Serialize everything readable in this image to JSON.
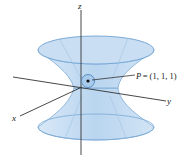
{
  "diagram": {
    "type": "hyperboloid-of-one-sheet",
    "axes": {
      "x_label": "x",
      "y_label": "y",
      "z_label": "z"
    },
    "point": {
      "name": "P",
      "coords_label": "= (1, 1, 1)"
    },
    "colors": {
      "surface_fill": "#cfe3f5",
      "surface_edge": "#6fa3d4",
      "axis": "#333333"
    }
  }
}
